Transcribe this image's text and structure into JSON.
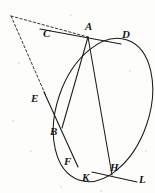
{
  "figure": {
    "background_color": "#fdfdfc",
    "stroke_color": "#1a1a1a",
    "label_color": "#1a1a1a",
    "width": 155,
    "height": 193
  },
  "labels": [
    {
      "id": "label-A",
      "text": "A",
      "x": 85,
      "y": 21
    },
    {
      "id": "label-C",
      "text": "C",
      "x": 43,
      "y": 28
    },
    {
      "id": "label-D",
      "text": "D",
      "x": 122,
      "y": 29
    },
    {
      "id": "label-E",
      "text": "E",
      "x": 31,
      "y": 93
    },
    {
      "id": "label-B",
      "text": "B",
      "x": 50,
      "y": 126
    },
    {
      "id": "label-F",
      "text": "F",
      "x": 64,
      "y": 156
    },
    {
      "id": "label-K",
      "text": "K",
      "x": 82,
      "y": 172
    },
    {
      "id": "label-H",
      "text": "H",
      "x": 110,
      "y": 162
    },
    {
      "id": "label-L",
      "text": "L",
      "x": 139,
      "y": 174
    }
  ],
  "points": {
    "A": {
      "x": 88,
      "y": 37
    },
    "B": {
      "x": 62,
      "y": 127
    },
    "E": {
      "x": 45,
      "y": 95
    },
    "F": {
      "x": 76,
      "y": 165
    },
    "H": {
      "x": 112,
      "y": 174
    },
    "K": {
      "x": 93,
      "y": 177
    },
    "L": {
      "x": 136,
      "y": 182
    },
    "C": {
      "x": 40,
      "y": 30
    },
    "D": {
      "x": 120,
      "y": 44
    },
    "P": {
      "x": 11,
      "y": 16
    }
  },
  "ellipse": {
    "center_x": 103,
    "center_y": 110,
    "radius_x": 46,
    "radius_y": 74,
    "rotation_deg": 19
  },
  "segments": [
    {
      "id": "tangent-CD",
      "from": "C",
      "to": "D",
      "style": "solid",
      "through": "A"
    },
    {
      "id": "tangent-KL",
      "from": "K",
      "to": "L",
      "style": "solid",
      "through": "H"
    },
    {
      "id": "chord-AB",
      "from": "A",
      "to": "B",
      "style": "solid"
    },
    {
      "id": "chord-AH",
      "from": "A",
      "to": "H",
      "style": "solid"
    },
    {
      "id": "secant-EBF",
      "from": "E",
      "to": "F",
      "style": "solid",
      "through": "B"
    },
    {
      "id": "dashed-PA",
      "from": "P",
      "to": "A",
      "style": "dashed"
    },
    {
      "id": "dashed-PE",
      "from": "P",
      "to": "E",
      "style": "dashed"
    }
  ],
  "speckles": [
    {
      "x": 18,
      "y": 62,
      "d": 2
    },
    {
      "x": 30,
      "y": 150,
      "d": 2
    },
    {
      "x": 129,
      "y": 70,
      "d": 2
    },
    {
      "x": 70,
      "y": 14,
      "d": 2
    },
    {
      "x": 145,
      "y": 150,
      "d": 2
    },
    {
      "x": 100,
      "y": 190,
      "d": 2
    },
    {
      "x": 12,
      "y": 120,
      "d": 2
    },
    {
      "x": 60,
      "y": 186,
      "d": 2
    }
  ]
}
